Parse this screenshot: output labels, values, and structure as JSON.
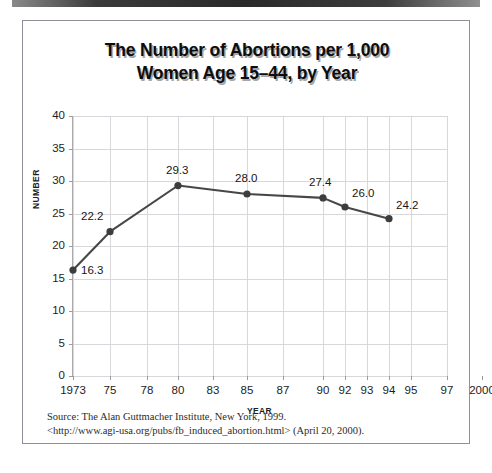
{
  "figure": {
    "title_line1": "The Number of Abortions per 1,000",
    "title_line2": "Women Age 15–44, by Year",
    "source_line1": "Source: The Alan Guttmacher Institute, New York, 1999.",
    "source_line2": "<http://www.agi-usa.org/pubs/fb_induced_abortion.html> (April 20, 2000)."
  },
  "colors": {
    "line": "#474747",
    "marker": "#3d3d3d",
    "grid": "#d8d8dc",
    "axis": "#a9a9ae",
    "frame": "#8e9099",
    "text": "#1d1d1d"
  },
  "chart_data": {
    "type": "line",
    "title": "The Number of Abortions per 1,000 Women Age 15–44, by Year",
    "xlabel": "YEAR",
    "ylabel": "NUMBER",
    "ylim": [
      0,
      40
    ],
    "ytick_values": [
      0,
      5,
      10,
      15,
      20,
      25,
      30,
      35,
      40
    ],
    "ytick_labels": [
      "0",
      "5",
      "10",
      "15",
      "20",
      "25",
      "30",
      "35",
      "40"
    ],
    "xtick_labels": [
      "1973",
      "75",
      "78",
      "80",
      "83",
      "85",
      "87",
      "90",
      "92",
      "93",
      "94",
      "95",
      "97",
      "2000"
    ],
    "xtick_positions_px": [
      0,
      37,
      74,
      105,
      140,
      174,
      210,
      250,
      272,
      294,
      316,
      338,
      374,
      409
    ],
    "grid": true,
    "grid_axes": "both",
    "legend": "none",
    "series": [
      {
        "name": "Abortions per 1,000 women age 15–44",
        "x": [
          "1973",
          "75",
          "80",
          "85",
          "90",
          "92",
          "94"
        ],
        "values": [
          16.3,
          22.2,
          29.3,
          28.0,
          27.4,
          26.0,
          24.2
        ],
        "data_labels": [
          "16.3",
          "22.2",
          "29.3",
          "28.0",
          "27.4",
          "26.0",
          "24.2"
        ]
      }
    ]
  },
  "points": [
    {
      "year": "1973",
      "value": 16.3,
      "label": "16.3",
      "px": 0,
      "label_dx": 8,
      "label_dy": -6
    },
    {
      "year": "75",
      "value": 22.2,
      "label": "22.2",
      "px": 37,
      "label_dx": -29,
      "label_dy": -22
    },
    {
      "year": "80",
      "value": 29.3,
      "label": "29.3",
      "px": 105,
      "label_dx": -12,
      "label_dy": -22
    },
    {
      "year": "85",
      "value": 28.0,
      "label": "28.0",
      "px": 174,
      "label_dx": -12,
      "label_dy": -22
    },
    {
      "year": "90",
      "value": 27.4,
      "label": "27.4",
      "px": 250,
      "label_dx": -14,
      "label_dy": -22
    },
    {
      "year": "92",
      "value": 26.0,
      "label": "26.0",
      "px": 272,
      "label_dx": 7,
      "label_dy": -20
    },
    {
      "year": "94",
      "value": 24.2,
      "label": "24.2",
      "px": 316,
      "label_dx": 7,
      "label_dy": -20
    }
  ],
  "gridlines_v_px": [
    0,
    37,
    74,
    105,
    140,
    174,
    210,
    250,
    272,
    294,
    316,
    338,
    374
  ]
}
